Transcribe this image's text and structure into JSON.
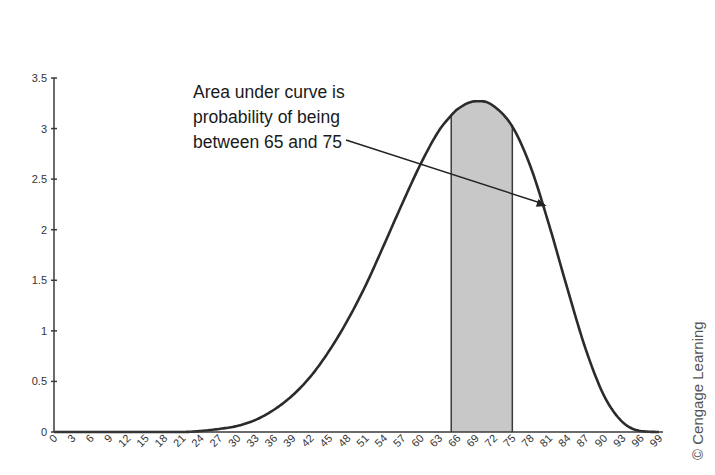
{
  "chart_data": {
    "type": "area",
    "title": "",
    "xlabel": "",
    "ylabel": "",
    "xlim": [
      0,
      99
    ],
    "ylim": [
      0,
      3.5
    ],
    "grid": false,
    "legend": null,
    "y_ticks": [
      0,
      0.5,
      1,
      1.5,
      2,
      2.5,
      3,
      3.5
    ],
    "y_tick_labels": [
      "0",
      "0.5",
      "1",
      "1.5",
      "2",
      "2.5",
      "3",
      "3.5"
    ],
    "x_ticks": [
      0,
      3,
      6,
      9,
      12,
      15,
      18,
      21,
      24,
      27,
      30,
      33,
      36,
      39,
      42,
      45,
      48,
      51,
      54,
      57,
      60,
      63,
      66,
      69,
      72,
      75,
      78,
      81,
      84,
      87,
      90,
      93,
      96,
      99
    ],
    "x_tick_labels": [
      "0",
      "3",
      "6",
      "9",
      "12",
      "15",
      "18",
      "21",
      "24",
      "27",
      "30",
      "33",
      "36",
      "39",
      "42",
      "45",
      "48",
      "51",
      "54",
      "57",
      "60",
      "63",
      "66",
      "69",
      "72",
      "75",
      "78",
      "81",
      "84",
      "87",
      "90",
      "93",
      "96",
      "99"
    ],
    "x_tick_label_rotation": -45,
    "series": [
      {
        "name": "density",
        "style": "line",
        "x": [
          0,
          15,
          21,
          24,
          27,
          30,
          33,
          36,
          39,
          42,
          45,
          48,
          51,
          54,
          57,
          60,
          63,
          65,
          66,
          69,
          70,
          72,
          75,
          78,
          81,
          84,
          87,
          90,
          93,
          96,
          99
        ],
        "y": [
          0,
          0,
          0.0,
          0.01,
          0.03,
          0.06,
          0.12,
          0.22,
          0.36,
          0.55,
          0.8,
          1.1,
          1.45,
          1.85,
          2.26,
          2.65,
          2.98,
          3.13,
          3.19,
          3.27,
          3.27,
          3.22,
          3.02,
          2.62,
          2.05,
          1.42,
          0.82,
          0.36,
          0.1,
          0.01,
          0
        ]
      }
    ],
    "shaded_region": {
      "x_start": 65,
      "x_end": 75,
      "fill": "#c8c8c8",
      "stroke": "#3a3a3a"
    },
    "annotations": [
      {
        "text_lines": [
          "Area under curve is",
          "probability of being",
          "between 65 and 75"
        ],
        "arrow_from": [
          51,
          2.5
        ],
        "arrow_to": [
          69,
          1.95
        ]
      }
    ],
    "credit": "© Cengage Learning"
  },
  "annotation": {
    "line1": "Area under curve is",
    "line2": "probability of being",
    "line3": "between 65 and 75"
  },
  "credit": "© Cengage Learning",
  "colors": {
    "axis": "#3a3a3a",
    "curve": "#2b2b2b",
    "shade": "#c8c8c8",
    "text": "#333333"
  }
}
